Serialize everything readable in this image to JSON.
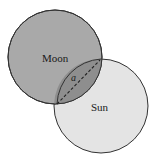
{
  "diagram": {
    "labels": {
      "moon": "Moon",
      "sun": "Sun",
      "chord": "a"
    },
    "colors": {
      "moon_fill": "#a9a9a9",
      "sun_fill": "#e4e4e4",
      "overlap_fill": "#8e8e8e",
      "stroke": "#333333"
    }
  }
}
